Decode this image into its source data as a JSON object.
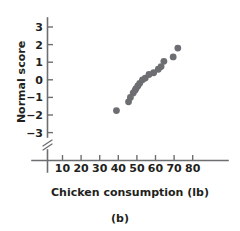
{
  "chart_data": {
    "type": "scatter",
    "title": "",
    "subtitle": "",
    "caption": "(b)",
    "xlabel": "Chicken consumption (lb)",
    "ylabel": "Normal score",
    "xlim": [
      0,
      85
    ],
    "ylim": [
      -3.8,
      3.6
    ],
    "xticks": [
      10,
      20,
      30,
      40,
      50,
      60,
      70,
      80
    ],
    "yticks": [
      3,
      2,
      1,
      0,
      -1,
      -2,
      -3
    ],
    "xticklabels": [
      "10",
      "20",
      "30",
      "40",
      "50",
      "60",
      "70",
      "80"
    ],
    "yticklabels": [
      "3",
      "2",
      "1",
      "0",
      "−1",
      "−2",
      "−3"
    ],
    "grid": false,
    "legend": null,
    "axis_break": {
      "axis": "y",
      "symbol": "double-slash",
      "below_value": -3
    },
    "marker": {
      "shape": "circle",
      "color": "#6d6e71",
      "size": 3.4
    },
    "x": [
      39.0,
      45.5,
      46.5,
      48.0,
      49.0,
      49.5,
      50.5,
      51.5,
      53.0,
      54.5,
      56.5,
      59.0,
      61.5,
      63.0,
      64.5,
      69.5,
      72.0
    ],
    "y": [
      -1.75,
      -1.25,
      -1.0,
      -0.75,
      -0.6,
      -0.5,
      -0.35,
      -0.2,
      0.0,
      0.1,
      0.3,
      0.4,
      0.6,
      0.75,
      1.05,
      1.3,
      1.8
    ],
    "points": [
      {
        "x": 39.0,
        "y": -1.75
      },
      {
        "x": 45.5,
        "y": -1.25
      },
      {
        "x": 46.5,
        "y": -1.0
      },
      {
        "x": 48.0,
        "y": -0.75
      },
      {
        "x": 49.0,
        "y": -0.6
      },
      {
        "x": 49.5,
        "y": -0.5
      },
      {
        "x": 50.5,
        "y": -0.35
      },
      {
        "x": 51.5,
        "y": -0.2
      },
      {
        "x": 53.0,
        "y": 0.0
      },
      {
        "x": 54.5,
        "y": 0.1
      },
      {
        "x": 56.5,
        "y": 0.3
      },
      {
        "x": 59.0,
        "y": 0.4
      },
      {
        "x": 61.5,
        "y": 0.6
      },
      {
        "x": 63.0,
        "y": 0.75
      },
      {
        "x": 64.5,
        "y": 1.05
      },
      {
        "x": 69.5,
        "y": 1.3
      },
      {
        "x": 72.0,
        "y": 1.8
      }
    ]
  },
  "figure": {
    "caption": "(b)",
    "xlabel": "Chicken consumption (lb)",
    "ylabel": "Normal score",
    "colors": {
      "marker": "#6d6e71",
      "axis": "#6d6e71",
      "text": "#231f20",
      "background": "#ffffff"
    }
  }
}
